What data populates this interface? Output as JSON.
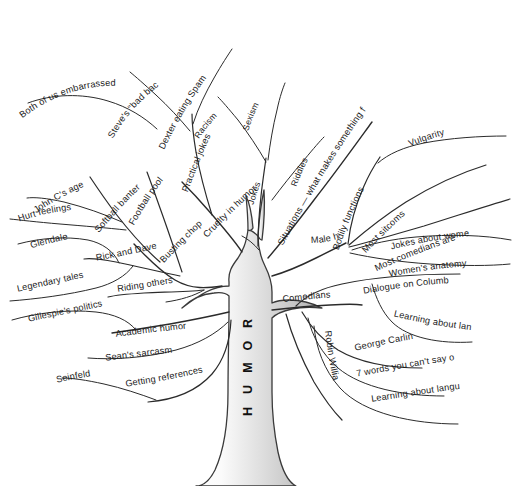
{
  "diagram": {
    "type": "tree-mind-map",
    "title": "HUMOR",
    "root_label": "HUMOR",
    "background_color": "#ffffff",
    "line_color": "#2b2b2b",
    "trunk_fill_light": "#ffffff",
    "trunk_fill_dark": "#b9b9b9",
    "text_color": "#1a1a1a"
  },
  "labels": {
    "dexter_eating_spam": "Dexter eating Spam",
    "steves_bad_back": "Steve's \"bad back\"",
    "both_of_us_embarrassed": "Both of us embarrassed",
    "practical_jokes": "Practical jokes",
    "racism": "Racism",
    "sexism": "Sexism",
    "jokes": "Jokes",
    "riddles": "Riddles",
    "situations": "Situations — what makes something funny",
    "vulgarity": "Vulgarity",
    "bodily_functions": "Bodily functions",
    "most_sitcoms": "Most sitcoms",
    "most_comedians_are_men": "Most comedians are men",
    "jokes_about_women": "Jokes about women",
    "womens_anatomy": "Women's anatomy",
    "male_humor": "Male humor",
    "cruelty_in_humor": "Cruelty in humor",
    "football_pool": "Football pool",
    "softball_banter": "Softball banter",
    "john_cs_age": "John C's age",
    "hurt_feelings": "Hurt feelings",
    "glendale": "Glendale",
    "rick_and_dave": "Rick and Dave",
    "legendary_tales": "Legendary tales",
    "busting_chops": "Busting chops",
    "riding_others": "Riding others",
    "gillespies_politics": "Gillespie's politics",
    "academic_humor": "Academic humor",
    "seans_sarcasm": "Sean's sarcasm",
    "seinfeld": "Seinfeld",
    "getting_references": "Getting references",
    "comedians": "Comedians",
    "dialogue_on_columbus": "Dialogue on Columbus",
    "learning_about_language_1": "Learning about language",
    "george_carlin": "George Carlin",
    "seven_words": "7 words you can't say on TV",
    "learning_about_language_2": "Learning about language",
    "robin_williams": "Robin Williams"
  },
  "structure": {
    "root": "HUMOR",
    "branches": [
      {
        "label": "Busting chops",
        "children": [
          {
            "label": "Football pool",
            "children": []
          },
          {
            "label": "Softball banter",
            "children": [
              {
                "label": "John C's age",
                "children": []
              },
              {
                "label": "Hurt feelings",
                "children": []
              }
            ]
          },
          {
            "label": "Rick and Dave",
            "children": [
              {
                "label": "Glendale",
                "children": []
              },
              {
                "label": "Legendary tales",
                "children": []
              }
            ]
          },
          {
            "label": "Riding others",
            "children": []
          }
        ]
      },
      {
        "label": "Cruelty in humor",
        "children": [
          {
            "label": "Practical jokes",
            "children": [
              {
                "label": "Dexter eating Spam",
                "children": []
              },
              {
                "label": "Steve's \"bad back\"",
                "children": [
                  {
                    "label": "Both of us embarrassed",
                    "children": []
                  }
                ]
              }
            ]
          }
        ]
      },
      {
        "label": "Jokes",
        "children": [
          {
            "label": "Racism",
            "children": []
          },
          {
            "label": "Sexism",
            "children": []
          },
          {
            "label": "Riddles",
            "children": []
          }
        ]
      },
      {
        "label": "Situations — what makes something funny",
        "children": []
      },
      {
        "label": "Male humor",
        "children": [
          {
            "label": "Bodily functions",
            "children": [
              {
                "label": "Vulgarity",
                "children": []
              }
            ]
          },
          {
            "label": "Most sitcoms",
            "children": []
          },
          {
            "label": "Most comedians are men",
            "children": [
              {
                "label": "Jokes about women",
                "children": []
              },
              {
                "label": "Women's anatomy",
                "children": []
              }
            ]
          }
        ]
      },
      {
        "label": "Academic humor",
        "children": [
          {
            "label": "Gillespie's politics",
            "children": []
          },
          {
            "label": "Sean's sarcasm",
            "children": []
          },
          {
            "label": "Getting references",
            "children": [
              {
                "label": "Seinfeld",
                "children": []
              }
            ]
          }
        ]
      },
      {
        "label": "Comedians",
        "children": [
          {
            "label": "Dialogue on Columbus",
            "children": [
              {
                "label": "Learning about language",
                "children": []
              }
            ]
          },
          {
            "label": "George Carlin",
            "children": [
              {
                "label": "7 words you can't say on TV",
                "children": []
              },
              {
                "label": "Learning about language",
                "children": []
              }
            ]
          },
          {
            "label": "Robin Williams",
            "children": []
          }
        ]
      }
    ]
  }
}
